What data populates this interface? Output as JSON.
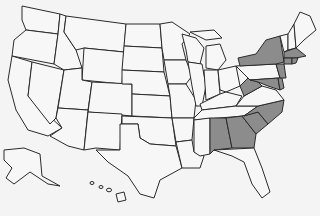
{
  "map": {
    "title": "",
    "region": "United States",
    "colors": {
      "shaded": "#8c8c8c",
      "unshaded": "#f7f7f7",
      "border": "#2a2a2a",
      "background": "#f4f4f4"
    },
    "shaded_states": [
      "New York",
      "Massachusetts",
      "Connecticut",
      "Rhode Island",
      "New Jersey",
      "Delaware",
      "Maryland",
      "West Virginia",
      "North Carolina",
      "South Carolina",
      "Georgia",
      "Alabama"
    ],
    "states": [
      {
        "id": "WA",
        "shaded": false,
        "points": "22,6 60,14 58,34 26,30 22,20"
      },
      {
        "id": "OR",
        "shaded": false,
        "points": "26,30 58,34 54,64 12,56 14,40"
      },
      {
        "id": "CA",
        "shaded": false,
        "points": "12,56 32,62 28,96 62,128 48,136 28,130 16,110 8,80"
      },
      {
        "id": "NV",
        "shaded": false,
        "points": "32,62 64,70 56,118 50,124 28,96"
      },
      {
        "id": "ID",
        "shaded": false,
        "points": "60,14 66,16 64,32 76,50 82,68 64,70 54,64 58,34"
      },
      {
        "id": "MT",
        "shaded": false,
        "points": "66,16 126,24 124,52 84,48 76,50 64,32"
      },
      {
        "id": "WY",
        "shaded": false,
        "points": "84,48 124,52 122,84 82,80"
      },
      {
        "id": "UT",
        "shaded": false,
        "points": "64,70 82,68 82,80 92,82 88,110 58,108"
      },
      {
        "id": "CO",
        "shaded": false,
        "points": "92,82 132,84 132,116 88,112"
      },
      {
        "id": "AZ",
        "shaded": false,
        "points": "58,108 88,110 84,150 68,146 50,136 62,128 56,118"
      },
      {
        "id": "NM",
        "shaded": false,
        "points": "88,112 122,114 120,150 96,148 84,150"
      },
      {
        "id": "ND",
        "shaded": false,
        "points": "126,24 160,24 162,48 124,46"
      },
      {
        "id": "SD",
        "shaded": false,
        "points": "124,46 162,48 164,72 122,70"
      },
      {
        "id": "NE",
        "shaded": false,
        "points": "122,70 164,72 170,96 132,94 132,84 122,84"
      },
      {
        "id": "KS",
        "shaded": false,
        "points": "132,94 170,96 172,118 132,116"
      },
      {
        "id": "OK",
        "shaded": false,
        "points": "122,116 172,118 176,146 150,144 140,138 138,124 122,124"
      },
      {
        "id": "TX",
        "shaded": false,
        "points": "120,124 138,124 140,138 150,144 176,146 182,168 160,180 154,198 140,194 128,176 108,162 96,150 120,150"
      },
      {
        "id": "MN",
        "shaded": false,
        "points": "160,24 172,22 190,34 182,44 186,60 164,60 162,48"
      },
      {
        "id": "IA",
        "shaded": false,
        "points": "164,60 186,60 192,76 186,84 168,84"
      },
      {
        "id": "MO",
        "shaded": false,
        "points": "168,84 186,84 196,100 194,118 172,118 170,96"
      },
      {
        "id": "AR",
        "shaded": false,
        "points": "172,118 194,118 192,140 176,142"
      },
      {
        "id": "LA",
        "shaded": false,
        "points": "176,142 192,140 194,152 204,156 200,168 182,168"
      },
      {
        "id": "WI",
        "shaded": false,
        "points": "182,34 196,38 204,48 200,64 188,62 186,50"
      },
      {
        "id": "IL",
        "shaded": false,
        "points": "188,62 202,64 206,86 202,106 196,106 192,86"
      },
      {
        "id": "MI",
        "shaded": false,
        "points": "206,46 220,44 226,60 218,70 206,68"
      },
      {
        "id": "MIU",
        "shaded": false,
        "points": "190,32 214,30 222,38 206,40"
      },
      {
        "id": "IN",
        "shaded": false,
        "points": "204,70 218,70 220,94 206,100"
      },
      {
        "id": "OH",
        "shaded": false,
        "points": "218,70 236,66 240,86 226,92 220,90"
      },
      {
        "id": "KY",
        "shaded": false,
        "points": "200,104 220,94 226,92 242,96 236,106 202,110"
      },
      {
        "id": "TN",
        "shaded": false,
        "points": "194,118 202,110 236,106 258,106 244,116 194,120"
      },
      {
        "id": "MS",
        "shaded": false,
        "points": "194,120 210,118 210,154 200,156 194,152"
      },
      {
        "id": "AL",
        "shaded": true,
        "points": "210,118 226,118 232,148 214,150 210,154"
      },
      {
        "id": "GA",
        "shaded": true,
        "points": "226,118 242,116 256,134 254,148 232,148"
      },
      {
        "id": "FL",
        "shaded": false,
        "points": "214,150 254,148 262,168 270,192 262,198 252,184 244,162 232,156"
      },
      {
        "id": "SC",
        "shaded": true,
        "points": "242,116 258,112 268,124 256,134"
      },
      {
        "id": "NC",
        "shaded": true,
        "points": "244,116 258,106 284,100 282,112 268,124 258,112"
      },
      {
        "id": "VA",
        "shaded": false,
        "points": "236,106 244,96 262,86 276,90 284,100 258,106"
      },
      {
        "id": "WV",
        "shaded": true,
        "points": "240,86 248,78 258,82 262,86 244,96"
      },
      {
        "id": "PA",
        "shaded": false,
        "points": "236,66 276,64 280,78 250,80"
      },
      {
        "id": "MD",
        "shaded": true,
        "points": "250,80 278,78 280,90 268,86 258,82"
      },
      {
        "id": "DE",
        "shaded": true,
        "points": "278,78 282,78 284,88 280,90"
      },
      {
        "id": "NJ",
        "shaded": true,
        "points": "276,64 284,64 286,78 280,78"
      },
      {
        "id": "NY",
        "shaded": true,
        "points": "238,58 256,54 266,40 280,36 284,62 276,64 240,66"
      },
      {
        "id": "VT",
        "shaded": false,
        "points": "280,36 288,34 288,50 284,52"
      },
      {
        "id": "NH",
        "shaded": false,
        "points": "288,34 294,24 296,48 288,50"
      },
      {
        "id": "ME",
        "shaded": false,
        "points": "294,24 300,12 310,16 316,30 304,40 296,48"
      },
      {
        "id": "MA",
        "shaded": true,
        "points": "284,52 296,48 306,56 296,58 284,58"
      },
      {
        "id": "CT",
        "shaded": true,
        "points": "284,58 292,58 292,64 284,64"
      },
      {
        "id": "RI",
        "shaded": true,
        "points": "292,58 298,58 296,63 292,64"
      },
      {
        "id": "AK",
        "shaded": false,
        "points": "4,150 24,148 40,154 42,176 60,186 48,184 30,172 14,184 6,178 12,168 4,160"
      },
      {
        "id": "HI",
        "shaded": false,
        "points": "116,194 124,192 126,200 118,202"
      }
    ]
  }
}
